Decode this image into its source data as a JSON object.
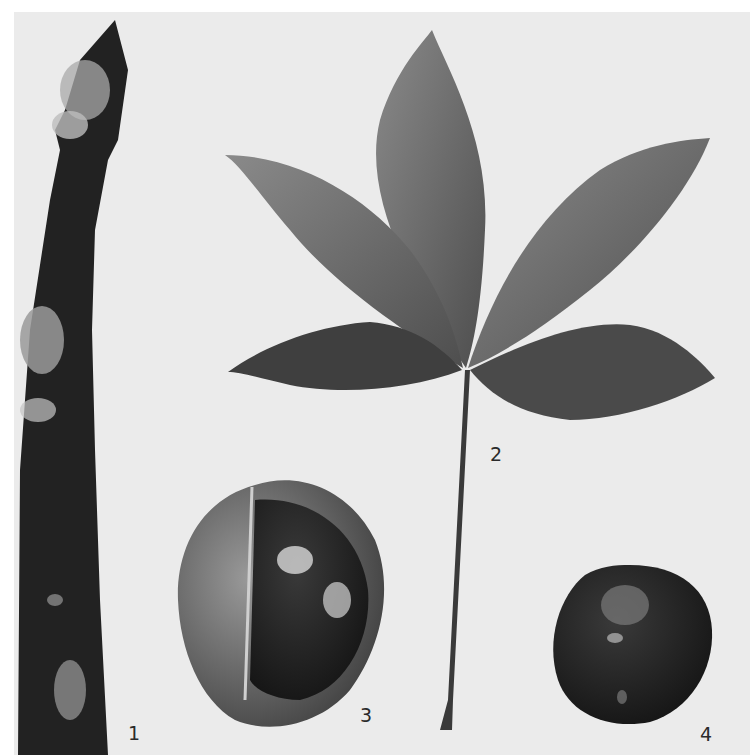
{
  "plate": {
    "background": "#ebebeb",
    "figures": [
      {
        "number": "1",
        "subject": "twig with terminal bud"
      },
      {
        "number": "2",
        "subject": "palmately compound leaf with five leaflets and long petiole"
      },
      {
        "number": "3",
        "subject": "split fruit husk revealing glossy seed"
      },
      {
        "number": "4",
        "subject": "glossy seed (conker)"
      }
    ]
  },
  "labels": {
    "fig1": "1",
    "fig2": "2",
    "fig3": "3",
    "fig4": "4"
  }
}
